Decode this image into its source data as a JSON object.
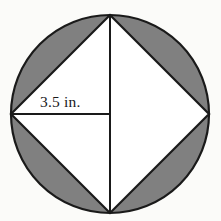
{
  "figure": {
    "background_color": "#fbfbf9",
    "shaded_color": "#808080",
    "unshaded_color": "#ffffff",
    "stroke_color": "#1a1a1a",
    "circle": {
      "center_x": 110,
      "center_y": 114,
      "radius": 99
    },
    "inscribed_square": {
      "vertices": [
        {
          "name": "top",
          "x": 110,
          "y": 15
        },
        {
          "name": "right",
          "x": 209,
          "y": 114
        },
        {
          "name": "bottom",
          "x": 110,
          "y": 213
        },
        {
          "name": "left",
          "x": 11,
          "y": 114
        }
      ]
    },
    "radii": [
      {
        "name": "radius-left",
        "from_x": 110,
        "from_y": 114,
        "to_x": 11,
        "to_y": 114
      },
      {
        "name": "radius-top",
        "from_x": 110,
        "from_y": 114,
        "to_x": 110,
        "to_y": 15
      },
      {
        "name": "radius-bottom",
        "from_x": 110,
        "from_y": 114,
        "to_x": 110,
        "to_y": 213
      }
    ],
    "dimension_label": "3.5 in."
  }
}
